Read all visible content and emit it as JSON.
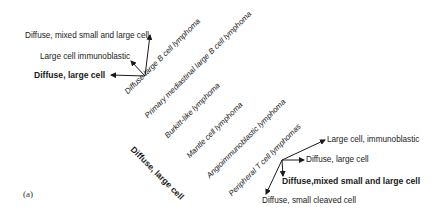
{
  "figure": {
    "panel_label": "(a)",
    "left_cluster": {
      "labels": [
        {
          "text": "Diffuse, mixed small and large cell",
          "bold": false
        },
        {
          "text": "Large cell immunoblastic",
          "bold": false
        },
        {
          "text": "Diffuse, large cell",
          "bold": true
        }
      ]
    },
    "diagonal_entities": [
      "Diffuse large B cell lymphoma",
      "Primary mediastinal large B cell lymphoma",
      "Burkitt-like lymphoma",
      "Mantle cell lymphoma",
      "Angioimmunoblastic lymphoma",
      "Peripheral T cell lymphomas"
    ],
    "category_label": "Diffuse, large cell",
    "right_cluster": {
      "labels": [
        {
          "text": "Large cell, immunoblastic",
          "bold": false
        },
        {
          "text": "Diffuse, large cell",
          "bold": false
        },
        {
          "text": "Diffuse,mixed small and large cell",
          "bold": true
        },
        {
          "text": "Diffuse, small cleaved cell",
          "bold": false
        }
      ]
    },
    "colors": {
      "text": "#1a1a1a",
      "arrow": "#1a1a1a",
      "background": "#ffffff"
    }
  }
}
